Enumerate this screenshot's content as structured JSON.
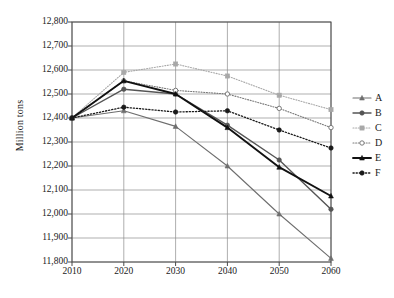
{
  "chart_data": {
    "type": "line",
    "title": "",
    "xlabel": "",
    "ylabel": "Million tons",
    "x": [
      2010,
      2020,
      2030,
      2040,
      2050,
      2060
    ],
    "xtick_labels": [
      "2010",
      "2020",
      "2030",
      "2040",
      "2050",
      "2060"
    ],
    "ytick_labels": [
      "12,800",
      "12,700",
      "12,600",
      "12,500",
      "12,400",
      "12,300",
      "12,200",
      "12,100",
      "12,000",
      "11,900",
      "11,800"
    ],
    "ytick_values": [
      12800,
      12700,
      12600,
      12500,
      12400,
      12300,
      12200,
      12100,
      12000,
      11900,
      11800
    ],
    "ylim": [
      11800,
      12800
    ],
    "xlim": [
      2010,
      2060
    ],
    "grid": true,
    "legend_position": "right",
    "series": [
      {
        "name": "A",
        "values": [
          12400,
          12430,
          12365,
          12200,
          12000,
          11815
        ],
        "color": "#6e6e6e",
        "line_style": "solid",
        "line_width": 1.1,
        "marker": "triangle"
      },
      {
        "name": "B",
        "values": [
          12400,
          12520,
          12500,
          12370,
          12225,
          12020
        ],
        "color": "#555555",
        "line_style": "solid",
        "line_width": 1.4,
        "marker": "circle"
      },
      {
        "name": "C",
        "values": [
          12400,
          12590,
          12625,
          12575,
          12495,
          12435
        ],
        "color": "#a8a8a8",
        "line_style": "dotted",
        "line_width": 1.1,
        "marker": "square"
      },
      {
        "name": "D",
        "values": [
          12400,
          12555,
          12515,
          12500,
          12440,
          12360
        ],
        "color": "#7a7a7a",
        "line_style": "dotted",
        "line_width": 1.1,
        "marker": "open-circle"
      },
      {
        "name": "E",
        "values": [
          12400,
          12555,
          12500,
          12360,
          12195,
          12075
        ],
        "color": "#111111",
        "line_style": "solid",
        "line_width": 1.9,
        "marker": "triangle"
      },
      {
        "name": "F",
        "values": [
          12400,
          12445,
          12425,
          12430,
          12350,
          12275
        ],
        "color": "#1a1a1a",
        "line_style": "dotted",
        "line_width": 1.3,
        "marker": "filled-circle"
      }
    ]
  },
  "legend": {
    "entries": [
      {
        "label": "A"
      },
      {
        "label": "B"
      },
      {
        "label": "C"
      },
      {
        "label": "D"
      },
      {
        "label": "E"
      },
      {
        "label": "F"
      }
    ]
  },
  "axes": {
    "frame_color": "#4a4a4a",
    "grid_color": "#8d8d8d"
  }
}
